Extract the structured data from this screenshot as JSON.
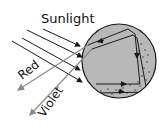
{
  "diagram": {
    "labels": {
      "sunlight": "Sunlight",
      "red": "Red",
      "violet": "Violet"
    },
    "colors": {
      "background": "#ffffff",
      "drop_fill": "#b8b8b8",
      "drop_stroke": "#1a1a1a",
      "ray": "#1a1a1a",
      "exit_ray": "#8a8a8a",
      "dots": "#333333"
    },
    "elements": [
      {
        "type": "raindrop",
        "shape": "circle"
      },
      {
        "type": "incoming-rays",
        "count": 4,
        "label": "Sunlight"
      },
      {
        "type": "exit-ray",
        "label": "Red"
      },
      {
        "type": "exit-ray",
        "label": "Violet"
      }
    ]
  }
}
